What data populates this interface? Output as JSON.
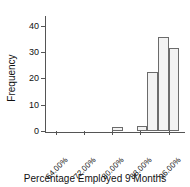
{
  "chart_data": {
    "type": "bar",
    "title": "",
    "subtitle": "",
    "xlabel": "Percentage Employed 9 Months",
    "ylabel": "Frequency",
    "grid": false,
    "legend": null,
    "xlim": [
      61.0,
      99.5
    ],
    "ylim": [
      0,
      43
    ],
    "ytick_labels": [
      "0",
      "10",
      "20",
      "30",
      "40"
    ],
    "ytick_values": [
      0,
      10,
      20,
      30,
      40
    ],
    "xtick_labels": [
      "64.00%",
      "72.00%",
      "80.00%",
      "88.00%",
      "96.00%"
    ],
    "xtick_values": [
      64,
      72,
      80,
      88,
      96
    ],
    "bin_width": 3.0,
    "bins": [
      {
        "left": 80.0,
        "right": 83.0,
        "center": 81.5,
        "value": 1.6
      },
      {
        "left": 87.0,
        "right": 90.0,
        "center": 88.5,
        "value": 1.8
      },
      {
        "left": 90.0,
        "right": 93.0,
        "center": 91.5,
        "value": 22.6
      },
      {
        "left": 93.0,
        "right": 96.0,
        "center": 94.5,
        "value": 35.8
      },
      {
        "left": 96.0,
        "right": 99.0,
        "center": 97.5,
        "value": 31.5
      }
    ],
    "categories": [
      "80.0-83.0",
      "87.0-90.0",
      "90.0-93.0",
      "93.0-96.0",
      "96.0-99.0"
    ],
    "values": [
      1.6,
      1.8,
      22.6,
      35.8,
      31.5
    ],
    "bar_face_color": "#f2f2f2",
    "bar_edge_color": "#6b6b6b",
    "axis_color": "#555555",
    "text_color": "#111111",
    "background_color": "#ffffff"
  }
}
